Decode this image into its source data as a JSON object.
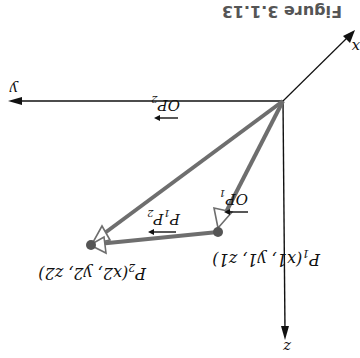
{
  "figure": {
    "caption": "Figure 3.1.13",
    "orientation": "rotated-180",
    "colors": {
      "axis": "#111111",
      "vector": "#6e6e6e",
      "point": "#555555",
      "caption": "#555555"
    },
    "axes": {
      "x_label": "x",
      "y_label": "y",
      "z_label": "z"
    },
    "points": {
      "origin": "O",
      "p1_label": "P1(x1, y1, z1)",
      "p1_name": "P",
      "p1_sub": "1",
      "p1_coords": "(x1, y1, z1)",
      "p2_label": "P2(x2, y2, z2)",
      "p2_name": "P",
      "p2_sub": "2",
      "p2_coords": "(x2, y2, z2)"
    },
    "vectors": {
      "op1": "OP1",
      "op2": "OP2",
      "p1p2": "P1P2"
    }
  }
}
